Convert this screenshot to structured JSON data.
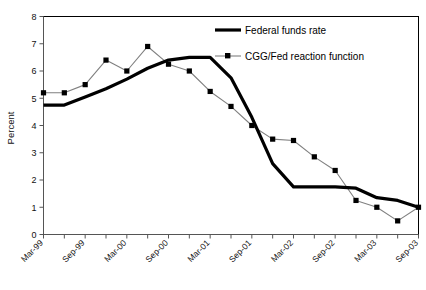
{
  "chart_data": {
    "type": "line",
    "title": "",
    "xlabel": "",
    "ylabel": "Percent",
    "ylim": [
      0,
      8
    ],
    "ytick_step": 1,
    "yticks": [
      "0",
      "1",
      "2",
      "3",
      "4",
      "5",
      "6",
      "7",
      "8"
    ],
    "grid": false,
    "legend_position": "upper-right-inside",
    "x": [
      "Mar-99",
      "Jun-99",
      "Sep-99",
      "Dec-99",
      "Mar-00",
      "Jun-00",
      "Sep-00",
      "Dec-00",
      "Mar-01",
      "Jun-01",
      "Sep-01",
      "Dec-01",
      "Mar-02",
      "Jun-02",
      "Sep-02",
      "Dec-02",
      "Mar-03",
      "Jun-03",
      "Sep-03"
    ],
    "xticklabels": [
      "Mar-99",
      "Sep-99",
      "Mar-00",
      "Sep-00",
      "Mar-01",
      "Sep-01",
      "Mar-02",
      "Sep-02",
      "Mar-03",
      "Sep-03"
    ],
    "xticklabel_rotation": 45,
    "series": [
      {
        "name": "Federal funds rate",
        "style": "thick-solid-black",
        "color": "#000000",
        "marker": "none",
        "values": [
          4.75,
          4.75,
          5.05,
          5.35,
          5.7,
          6.1,
          6.4,
          6.5,
          6.5,
          5.75,
          4.3,
          2.6,
          1.75,
          1.75,
          1.75,
          1.7,
          1.35,
          1.25,
          1.0
        ]
      },
      {
        "name": "CGG/Fed reaction function",
        "style": "thin-gray-with-square-markers",
        "color": "#808080",
        "marker": "square",
        "marker_color": "#000000",
        "values": [
          5.2,
          5.2,
          5.5,
          6.4,
          6.0,
          6.9,
          6.25,
          6.0,
          5.25,
          4.7,
          4.0,
          3.5,
          3.45,
          2.85,
          2.35,
          1.25,
          1.0,
          0.5,
          1.0
        ]
      }
    ]
  },
  "legend": {
    "items": [
      {
        "label": "Federal funds rate"
      },
      {
        "label": "CGG/Fed reaction function"
      }
    ]
  },
  "axis": {
    "y_title": "Percent"
  },
  "caption": {
    "text": "Note: the bottom caption line is cropped at the image edge and is not legible."
  }
}
